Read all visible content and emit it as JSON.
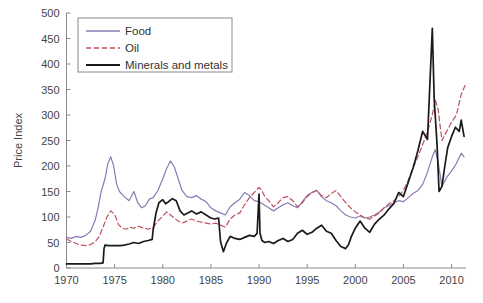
{
  "chart_data": {
    "type": "line",
    "title": "",
    "xlabel": "",
    "ylabel": "Price Index",
    "xlim": [
      1970,
      2011.5
    ],
    "ylim": [
      0,
      500
    ],
    "xticks": [
      1970,
      1975,
      1980,
      1985,
      1990,
      1995,
      2000,
      2005,
      2010
    ],
    "yticks": [
      0,
      50,
      100,
      150,
      200,
      250,
      300,
      350,
      400,
      450,
      500
    ],
    "grid": false,
    "legend_position": "upper-left",
    "series": [
      {
        "name": "Food",
        "color": "#8a7ab5",
        "style": "solid",
        "x": [
          1970.0,
          1970.5,
          1971.0,
          1971.5,
          1972.0,
          1972.5,
          1973.0,
          1973.3,
          1973.6,
          1974.0,
          1974.3,
          1974.6,
          1974.9,
          1975.2,
          1975.5,
          1976.0,
          1976.5,
          1977.0,
          1977.4,
          1977.8,
          1978.2,
          1978.6,
          1979.0,
          1979.5,
          1980.0,
          1980.4,
          1980.8,
          1981.2,
          1981.6,
          1982.0,
          1982.5,
          1983.0,
          1983.5,
          1984.0,
          1984.5,
          1985.0,
          1985.5,
          1986.0,
          1986.5,
          1987.0,
          1987.5,
          1988.0,
          1988.5,
          1989.0,
          1989.5,
          1990.0,
          1990.5,
          1991.0,
          1991.5,
          1992.0,
          1992.5,
          1993.0,
          1993.5,
          1994.0,
          1994.5,
          1995.0,
          1995.5,
          1996.0,
          1996.5,
          1997.0,
          1997.5,
          1998.0,
          1998.5,
          1999.0,
          1999.5,
          2000.0,
          2000.5,
          2001.0,
          2001.5,
          2002.0,
          2002.5,
          2003.0,
          2003.5,
          2004.0,
          2004.5,
          2005.0,
          2005.5,
          2006.0,
          2006.5,
          2007.0,
          2007.5,
          2008.0,
          2008.3,
          2008.6,
          2009.0,
          2009.5,
          2010.0,
          2010.5,
          2011.0,
          2011.3
        ],
        "y": [
          60,
          58,
          62,
          60,
          64,
          72,
          95,
          120,
          150,
          175,
          205,
          218,
          200,
          165,
          150,
          140,
          132,
          150,
          128,
          118,
          122,
          135,
          138,
          152,
          175,
          195,
          210,
          198,
          175,
          152,
          140,
          138,
          142,
          135,
          130,
          118,
          112,
          108,
          104,
          120,
          128,
          135,
          148,
          142,
          132,
          130,
          124,
          118,
          112,
          118,
          124,
          128,
          122,
          118,
          130,
          142,
          148,
          152,
          140,
          132,
          128,
          122,
          112,
          104,
          100,
          98,
          102,
          98,
          100,
          104,
          110,
          118,
          122,
          128,
          132,
          130,
          138,
          146,
          152,
          164,
          188,
          218,
          232,
          208,
          160,
          178,
          190,
          205,
          225,
          218
        ]
      },
      {
        "name": "Oil",
        "color": "#c0505e",
        "style": "dashed",
        "x": [
          1970.0,
          1970.5,
          1971.0,
          1971.5,
          1972.0,
          1972.5,
          1973.0,
          1973.4,
          1973.8,
          1974.2,
          1974.6,
          1975.0,
          1975.4,
          1975.8,
          1976.2,
          1976.6,
          1977.0,
          1977.5,
          1978.0,
          1978.5,
          1979.0,
          1979.5,
          1980.0,
          1980.4,
          1980.8,
          1981.2,
          1981.6,
          1982.0,
          1982.5,
          1983.0,
          1983.5,
          1984.0,
          1984.5,
          1985.0,
          1985.5,
          1986.0,
          1986.5,
          1987.0,
          1987.5,
          1988.0,
          1988.5,
          1989.0,
          1989.5,
          1990.0,
          1990.3,
          1990.6,
          1991.0,
          1991.5,
          1992.0,
          1992.5,
          1993.0,
          1993.5,
          1994.0,
          1994.5,
          1995.0,
          1995.5,
          1996.0,
          1996.5,
          1997.0,
          1997.5,
          1998.0,
          1998.5,
          1999.0,
          1999.5,
          2000.0,
          2000.5,
          2001.0,
          2001.5,
          2002.0,
          2002.5,
          2003.0,
          2003.5,
          2004.0,
          2004.5,
          2005.0,
          2005.5,
          2006.0,
          2006.5,
          2007.0,
          2007.5,
          2008.0,
          2008.3,
          2008.6,
          2009.0,
          2009.5,
          2010.0,
          2010.5,
          2011.0,
          2011.4
        ],
        "y": [
          57,
          52,
          48,
          45,
          44,
          46,
          52,
          62,
          80,
          100,
          112,
          105,
          85,
          78,
          76,
          80,
          78,
          82,
          78,
          76,
          80,
          92,
          102,
          110,
          104,
          98,
          92,
          88,
          92,
          96,
          92,
          90,
          88,
          86,
          88,
          84,
          80,
          96,
          104,
          108,
          124,
          138,
          148,
          158,
          152,
          140,
          132,
          120,
          128,
          138,
          140,
          132,
          120,
          128,
          140,
          148,
          152,
          142,
          138,
          146,
          152,
          140,
          128,
          118,
          110,
          104,
          98,
          96,
          102,
          108,
          118,
          126,
          132,
          140,
          152,
          172,
          196,
          218,
          242,
          268,
          300,
          330,
          312,
          250,
          268,
          286,
          300,
          340,
          358
        ]
      },
      {
        "name": "Minerals and metals",
        "color": "#1a1a1a",
        "style": "solid",
        "x": [
          1970.0,
          1970.5,
          1971.0,
          1971.5,
          1972.0,
          1972.5,
          1973.0,
          1973.5,
          1973.8,
          1973.9,
          1974.0,
          1974.4,
          1974.8,
          1975.2,
          1975.6,
          1976.0,
          1976.5,
          1977.0,
          1977.5,
          1978.0,
          1978.5,
          1978.9,
          1979.0,
          1979.3,
          1979.6,
          1980.0,
          1980.3,
          1980.6,
          1981.0,
          1981.4,
          1981.8,
          1982.2,
          1982.6,
          1983.0,
          1983.5,
          1984.0,
          1984.5,
          1985.0,
          1985.4,
          1985.8,
          1986.0,
          1986.3,
          1986.6,
          1987.0,
          1987.5,
          1988.0,
          1988.5,
          1989.0,
          1989.5,
          1989.8,
          1990.0,
          1990.1,
          1990.3,
          1990.6,
          1991.0,
          1991.5,
          1992.0,
          1992.5,
          1993.0,
          1993.5,
          1994.0,
          1994.5,
          1995.0,
          1995.5,
          1996.0,
          1996.5,
          1997.0,
          1997.5,
          1998.0,
          1998.5,
          1999.0,
          1999.3,
          1999.6,
          2000.0,
          2000.5,
          2001.0,
          2001.5,
          2002.0,
          2002.5,
          2003.0,
          2003.5,
          2004.0,
          2004.5,
          2005.0,
          2005.5,
          2006.0,
          2006.5,
          2007.0,
          2007.5,
          2008.0,
          2008.2,
          2008.5,
          2008.7,
          2009.0,
          2009.3,
          2009.6,
          2010.0,
          2010.4,
          2010.8,
          2011.0,
          2011.3
        ],
        "y": [
          8,
          8,
          8,
          8,
          8,
          8,
          9,
          9,
          10,
          38,
          45,
          44,
          44,
          44,
          44,
          45,
          47,
          50,
          48,
          52,
          54,
          56,
          75,
          108,
          128,
          134,
          126,
          130,
          136,
          132,
          112,
          104,
          108,
          112,
          106,
          110,
          104,
          98,
          96,
          98,
          52,
          32,
          48,
          62,
          58,
          56,
          60,
          64,
          62,
          68,
          145,
          68,
          54,
          50,
          52,
          48,
          54,
          58,
          52,
          56,
          68,
          74,
          66,
          70,
          78,
          84,
          72,
          68,
          54,
          42,
          38,
          46,
          62,
          78,
          92,
          78,
          70,
          86,
          96,
          104,
          116,
          126,
          148,
          140,
          168,
          196,
          230,
          268,
          252,
          470,
          330,
          240,
          150,
          160,
          200,
          236,
          258,
          276,
          268,
          290,
          258
        ]
      }
    ]
  },
  "legend": {
    "entries": [
      {
        "label": "Food"
      },
      {
        "label": "Oil"
      },
      {
        "label": "Minerals and metals"
      }
    ]
  },
  "axes": {
    "y_title": "Price Index",
    "y_tick_labels": [
      "0",
      "50",
      "100",
      "150",
      "200",
      "250",
      "300",
      "350",
      "400",
      "450",
      "500"
    ],
    "x_tick_labels": [
      "1970",
      "1975",
      "1980",
      "1985",
      "1990",
      "1995",
      "2000",
      "2005",
      "2010"
    ]
  }
}
